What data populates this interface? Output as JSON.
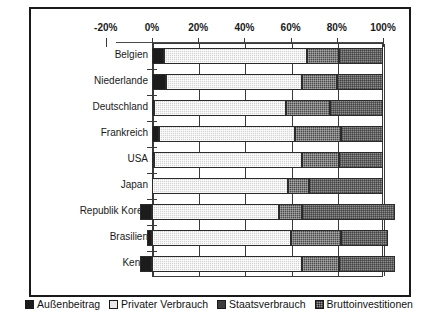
{
  "chart_data": {
    "type": "bar",
    "orientation": "horizontal",
    "stacked": true,
    "title": "",
    "xlabel": "",
    "ylabel": "",
    "xlim": [
      -20,
      100
    ],
    "xticks": [
      -20,
      0,
      20,
      40,
      60,
      80,
      100
    ],
    "xticklabels": [
      "-20%",
      "0%",
      "20%",
      "40%",
      "60%",
      "80%",
      "100%"
    ],
    "grid": true,
    "legend_position": "bottom",
    "categories": [
      "Belgien",
      "Niederlande",
      "Deutschland",
      "Frankreich",
      "USA",
      "Japan",
      "Republik Korea",
      "Brasilien",
      "Kenia"
    ],
    "series": [
      {
        "name": "Außenbeitrag",
        "color": "#1c1c1c",
        "values": [
          5,
          6,
          1,
          3,
          1,
          0,
          -5,
          -2,
          -5
        ]
      },
      {
        "name": "Privater Verbrauch",
        "color": "#d2d2d2",
        "values": [
          62,
          59,
          57,
          59,
          64,
          59,
          55,
          60,
          65
        ]
      },
      {
        "name": "Staatsverbrauch",
        "color": "#4a4a4a",
        "values": [
          14,
          15,
          19,
          20,
          16,
          9,
          10,
          22,
          16
        ]
      },
      {
        "name": "Bruttoinvestitionen",
        "color": "#8d8d8d",
        "values": [
          19,
          20,
          23,
          18,
          19,
          32,
          40,
          20,
          24
        ]
      }
    ]
  },
  "legend": {
    "items": [
      {
        "label": "Außenbeitrag"
      },
      {
        "label": "Privater Verbrauch"
      },
      {
        "label": "Staatsverbrauch"
      },
      {
        "label": "Bruttoinvestitionen"
      }
    ]
  }
}
